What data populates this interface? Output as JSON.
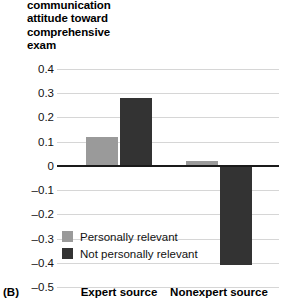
{
  "panel": {
    "letter": "(B)"
  },
  "chart_data": {
    "type": "bar",
    "title": "",
    "ylabel_lines": [
      "communication",
      "attitude toward",
      "comprehensive",
      "exam"
    ],
    "ylabel": "communication attitude toward comprehensive exam",
    "xlabel": "",
    "categories": [
      "Expert source",
      "Nonexpert source"
    ],
    "series": [
      {
        "name": "Personally relevant",
        "color": "#9a9a9a",
        "values": [
          0.12,
          0.02
        ]
      },
      {
        "name": "Not personally relevant",
        "color": "#333333",
        "values": [
          0.28,
          -0.41
        ]
      }
    ],
    "ylim": [
      -0.5,
      0.4
    ],
    "ytick_values": [
      0.4,
      0.3,
      0.2,
      0.1,
      0,
      -0.1,
      -0.2,
      -0.3,
      -0.4,
      -0.5
    ],
    "ytick_labels": [
      "0.4",
      "0.3",
      "0.2",
      "0.1",
      "0",
      "–0.1",
      "–0.2",
      "–0.3",
      "–0.4",
      "–0.5"
    ],
    "grid": true,
    "legend_position": "inside-lower-left",
    "zero_line": true
  },
  "colors": {
    "personally_relevant": "#9a9a9a",
    "not_personally_relevant": "#333333",
    "gridline": "#d6d6d6",
    "zeroline": "#1a1a1a",
    "background": "#ffffff"
  }
}
